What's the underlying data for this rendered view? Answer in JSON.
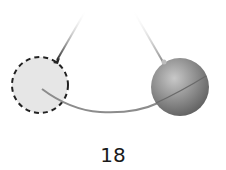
{
  "figure": {
    "label": "18",
    "colors": {
      "background": "#ffffff",
      "string_left": "#3a3a3a",
      "string_right": "#9a9a9a",
      "dashed_circle_fill": "#e6e6e6",
      "dashed_circle_stroke": "#222222",
      "ball_fill": "#8a8a8a",
      "arc": "#8c8c8c"
    }
  }
}
